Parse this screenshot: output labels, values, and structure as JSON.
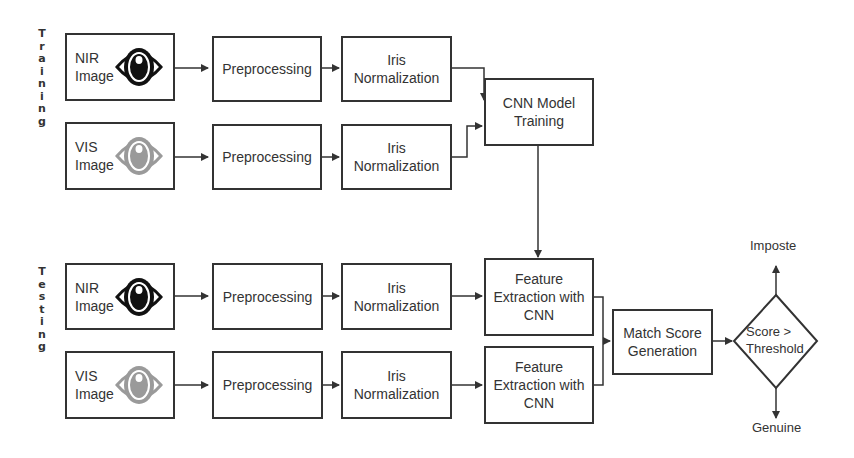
{
  "sections": {
    "training_label": "T\nr\na\ni\nn\ni\nn\ng",
    "testing_label": "T\ne\ns\nt\ni\nn\ng"
  },
  "training": {
    "nir": {
      "line1": "NIR",
      "line2": "Image"
    },
    "vis": {
      "line1": "VIS",
      "line2": "Image"
    },
    "pre1": "Preprocessing",
    "pre2": "Preprocessing",
    "norm1": {
      "line1": "Iris",
      "line2": "Normalization"
    },
    "norm2": {
      "line1": "Iris",
      "line2": "Normalization"
    },
    "cnn": {
      "line1": "CNN Model",
      "line2": "Training"
    }
  },
  "testing": {
    "nir": {
      "line1": "NIR",
      "line2": "Image"
    },
    "vis": {
      "line1": "VIS",
      "line2": "Image"
    },
    "pre1": "Preprocessing",
    "pre2": "Preprocessing",
    "norm1": {
      "line1": "Iris",
      "line2": "Normalization"
    },
    "norm2": {
      "line1": "Iris",
      "line2": "Normalization"
    },
    "feat1": {
      "line1": "Feature",
      "line2": "Extraction with",
      "line3": "CNN"
    },
    "feat2": {
      "line1": "Feature",
      "line2": "Extraction with",
      "line3": "CNN"
    },
    "match": {
      "line1": "Match Score",
      "line2": "Generation"
    },
    "decision": {
      "line1": "Score >",
      "line2": "Threshold"
    },
    "impostor": "Imposte",
    "genuine": "Genuine"
  },
  "icons": {
    "nir_eye_color": "#111111",
    "vis_eye_color": "#9a9a9a"
  }
}
